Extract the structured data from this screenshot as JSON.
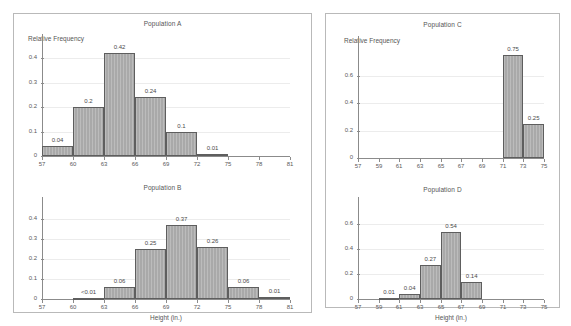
{
  "figure": {
    "panel_left_name": "left-panel",
    "panel_right_name": "right-panel",
    "axis_color": "#8b8b8b",
    "bar_fill": "#a9a9a9",
    "bar_edge": "#5e5e5e",
    "grid_color": "#ececec",
    "panel_border": "#b9b9b9",
    "background": "#ffffff"
  },
  "chart_data": [
    {
      "type": "bar",
      "title": "Population A",
      "xlabel": "",
      "ylabel": "Relative Frequency",
      "xlim": [
        57,
        81
      ],
      "ylim": [
        0,
        0.45
      ],
      "xticks": [
        57,
        60,
        63,
        66,
        69,
        72,
        75,
        78,
        81
      ],
      "yticks": [
        0,
        0.1,
        0.2,
        0.3,
        0.4
      ],
      "ytick_labels": [
        "0",
        "0.1",
        "0.2",
        "0.3",
        "0.4"
      ],
      "grid": true,
      "bin_width": 3,
      "bins": [
        {
          "start": 57,
          "end": 60,
          "value": 0.04,
          "label": "0.04"
        },
        {
          "start": 60,
          "end": 63,
          "value": 0.2,
          "label": "0.2"
        },
        {
          "start": 63,
          "end": 66,
          "value": 0.42,
          "label": "0.42"
        },
        {
          "start": 66,
          "end": 69,
          "value": 0.24,
          "label": "0.24"
        },
        {
          "start": 69,
          "end": 72,
          "value": 0.1,
          "label": "0.1"
        },
        {
          "start": 72,
          "end": 75,
          "value": 0.01,
          "label": "0.01"
        }
      ]
    },
    {
      "type": "bar",
      "title": "Population B",
      "xlabel": "Height (in.)",
      "ylabel": "",
      "xlim": [
        57,
        81
      ],
      "ylim": [
        0,
        0.45
      ],
      "xticks": [
        57,
        60,
        63,
        66,
        69,
        72,
        75,
        78,
        81
      ],
      "yticks": [
        0,
        0.1,
        0.2,
        0.3,
        0.4
      ],
      "ytick_labels": [
        "0",
        "0.1",
        "0.2",
        "0.3",
        "0.4"
      ],
      "grid": true,
      "bin_width": 3,
      "bins": [
        {
          "start": 60,
          "end": 63,
          "value": 0.004,
          "label": "<0.01"
        },
        {
          "start": 63,
          "end": 66,
          "value": 0.06,
          "label": "0.06"
        },
        {
          "start": 66,
          "end": 69,
          "value": 0.25,
          "label": "0.25"
        },
        {
          "start": 69,
          "end": 72,
          "value": 0.37,
          "label": "0.37"
        },
        {
          "start": 72,
          "end": 75,
          "value": 0.26,
          "label": "0.26"
        },
        {
          "start": 75,
          "end": 78,
          "value": 0.06,
          "label": "0.06"
        },
        {
          "start": 78,
          "end": 81,
          "value": 0.01,
          "label": "0.01"
        }
      ]
    },
    {
      "type": "bar",
      "title": "Population C",
      "xlabel": "",
      "ylabel": "Relative Frequency",
      "xlim": [
        57,
        75
      ],
      "ylim": [
        0,
        0.8
      ],
      "xticks": [
        57,
        59,
        61,
        63,
        65,
        67,
        69,
        71,
        73,
        75
      ],
      "yticks": [
        0,
        0.2,
        0.4,
        0.6
      ],
      "ytick_labels": [
        "0",
        "0.2",
        "0.4",
        "0.6"
      ],
      "grid": true,
      "bin_width": 2,
      "bins": [
        {
          "start": 71,
          "end": 73,
          "value": 0.75,
          "label": "0.75"
        },
        {
          "start": 73,
          "end": 75,
          "value": 0.25,
          "label": "0.25"
        }
      ]
    },
    {
      "type": "bar",
      "title": "Population D",
      "xlabel": "Height (in.)",
      "ylabel": "",
      "xlim": [
        57,
        75
      ],
      "ylim": [
        0,
        0.72
      ],
      "xticks": [
        57,
        59,
        61,
        63,
        65,
        67,
        69,
        71,
        73,
        75
      ],
      "yticks": [
        0,
        0.2,
        0.4,
        0.6
      ],
      "ytick_labels": [
        "0",
        "0.2",
        "0.4",
        "0.6"
      ],
      "grid": true,
      "bin_width": 2,
      "bins": [
        {
          "start": 59,
          "end": 61,
          "value": 0.01,
          "label": "0.01"
        },
        {
          "start": 61,
          "end": 63,
          "value": 0.04,
          "label": "0.04"
        },
        {
          "start": 63,
          "end": 65,
          "value": 0.27,
          "label": "0.27"
        },
        {
          "start": 65,
          "end": 67,
          "value": 0.54,
          "label": "0.54"
        },
        {
          "start": 67,
          "end": 69,
          "value": 0.14,
          "label": "0.14"
        }
      ]
    }
  ],
  "panels": [
    {
      "name": "left-panel",
      "charts": [
        0,
        1
      ]
    },
    {
      "name": "right-panel",
      "charts": [
        2,
        3
      ]
    }
  ]
}
